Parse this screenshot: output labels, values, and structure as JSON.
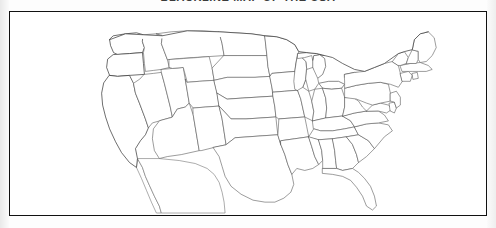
{
  "document": {
    "title_clipped": "BLACKLINE MAP OF THE USA",
    "title_visible_note": "cropped at top edge",
    "background_color": "#ffffff",
    "page_color": "#fdfdfd"
  },
  "frame": {
    "border_color": "#111111",
    "fill_color": "#ffffff",
    "x": 9,
    "y": 11,
    "width": 478,
    "height": 205
  },
  "map": {
    "name": "united-states-outline-map",
    "type": "blank-outline",
    "projection_note": "conic, contiguous 48 states",
    "state_line_color": "#4a4a4a",
    "coast_line_color": "#2e2e2e",
    "fill_color": "#ffffff",
    "labels_shown": false,
    "regions": [
      "Pacific Northwest",
      "California",
      "Great Basin",
      "Southwest",
      "Rocky Mountains",
      "Great Plains",
      "Midwest",
      "Great Lakes",
      "New England",
      "Mid-Atlantic",
      "Southeast",
      "Gulf Coast",
      "Florida Peninsula",
      "Texas"
    ],
    "features": [
      "Great Lakes",
      "Michigan Upper Peninsula",
      "Michigan Lower Peninsula",
      "Florida Peninsula",
      "Cape Cod",
      "Long Island",
      "Chesapeake Bay",
      "Gulf of Mexico coastline",
      "Pacific coastline",
      "Atlantic coastline",
      "Baja California",
      "Canadian border"
    ]
  }
}
